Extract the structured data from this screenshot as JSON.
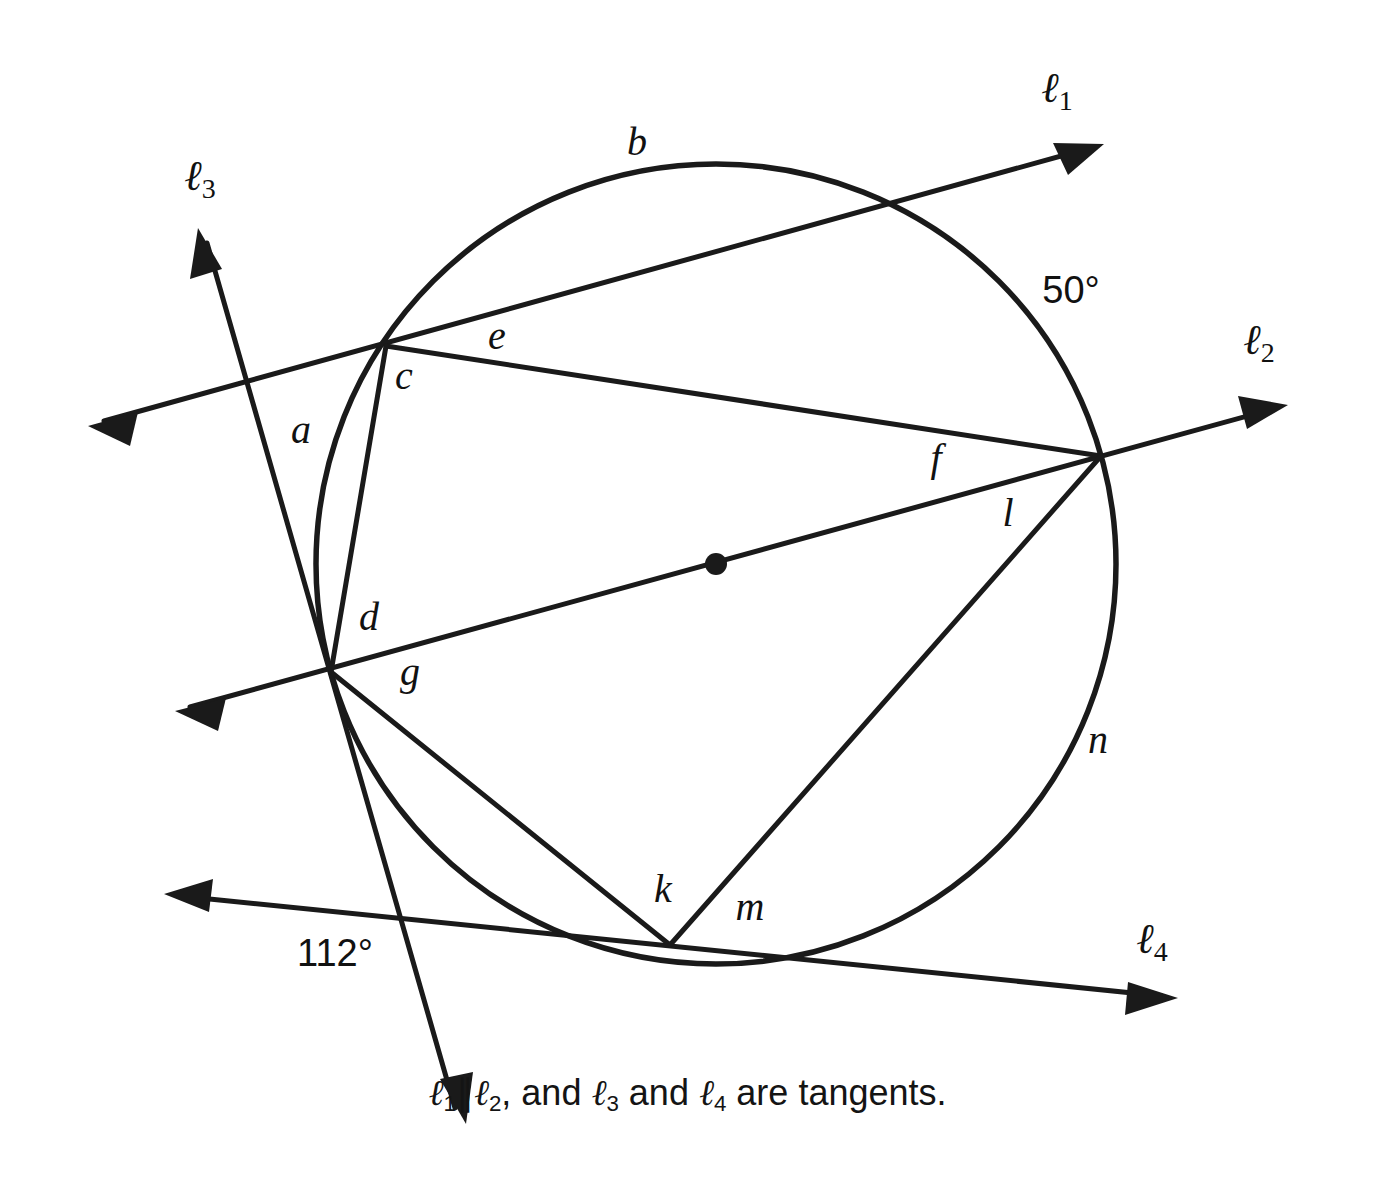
{
  "figure": {
    "type": "geometry-diagram",
    "background_color": "#ffffff",
    "ink_color": "#1a1a1a",
    "circle": {
      "cx": 716,
      "cy": 564,
      "r": 400,
      "center_dot": true
    },
    "line_labels": [
      {
        "id": "l1",
        "base": "ℓ",
        "sub": "1",
        "x": 1062,
        "y": 92
      },
      {
        "id": "l2",
        "base": "ℓ",
        "sub": "2",
        "x": 1264,
        "y": 344
      },
      {
        "id": "l3",
        "base": "ℓ",
        "sub": "3",
        "x": 205,
        "y": 180
      },
      {
        "id": "l4",
        "base": "ℓ",
        "sub": "4",
        "x": 1157,
        "y": 943
      }
    ],
    "arc_labels": [
      {
        "id": "a",
        "text": "a",
        "x": 301,
        "y": 434
      },
      {
        "id": "b",
        "text": "b",
        "x": 637,
        "y": 146
      },
      {
        "id": "c",
        "text": "c",
        "x": 404,
        "y": 380
      },
      {
        "id": "d",
        "text": "d",
        "x": 369,
        "y": 621
      },
      {
        "id": "e",
        "text": "e",
        "x": 497,
        "y": 340
      },
      {
        "id": "f",
        "text": "f",
        "x": 936,
        "y": 462
      },
      {
        "id": "g",
        "text": "g",
        "x": 410,
        "y": 676
      },
      {
        "id": "k",
        "text": "k",
        "x": 663,
        "y": 893
      },
      {
        "id": "l",
        "text": "l",
        "x": 1008,
        "y": 517
      },
      {
        "id": "m",
        "text": "m",
        "x": 750,
        "y": 911
      },
      {
        "id": "n",
        "text": "n",
        "x": 1098,
        "y": 744
      }
    ],
    "angle_labels": [
      {
        "id": "angle-50",
        "text": "50°",
        "x": 1071,
        "y": 293
      },
      {
        "id": "angle-112",
        "text": "112°",
        "x": 335,
        "y": 956
      }
    ],
    "caption": {
      "prefix": "",
      "l1": "ℓ",
      "l1_sub": "1",
      "parallel_symbol": "∥",
      "l2": "ℓ",
      "l2_sub": "2",
      "mid": ", and ",
      "l3": "ℓ",
      "l3_sub": "3",
      "conj": " and ",
      "l4": "ℓ",
      "l4_sub": "4",
      "suffix": " are tangents.",
      "full_text": "ℓ1∥ℓ2, and ℓ3 and ℓ4 are tangents."
    }
  }
}
